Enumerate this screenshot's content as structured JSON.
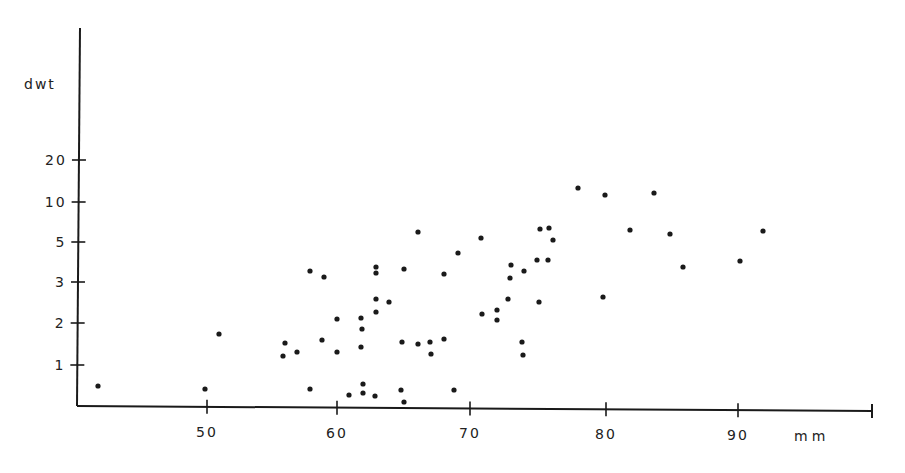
{
  "chart_data": {
    "type": "scatter",
    "title": "",
    "xlabel": "mm",
    "ylabel": "dwt",
    "x_ticks": [
      50,
      60,
      70,
      80,
      90
    ],
    "y_ticks": [
      1,
      2,
      3,
      5,
      10,
      20
    ],
    "xlim": [
      40,
      100
    ],
    "y_scale": "log-like (non-uniform)",
    "grid": false,
    "legend": null,
    "points": [
      {
        "x": 41.8,
        "y": 0.5
      },
      {
        "x": 50,
        "y": 0.4
      },
      {
        "x": 51,
        "y": 1.7
      },
      {
        "x": 56,
        "y": 1.5
      },
      {
        "x": 56,
        "y": 1.2
      },
      {
        "x": 57,
        "y": 1.3
      },
      {
        "x": 58,
        "y": 3.3
      },
      {
        "x": 58,
        "y": 0.4
      },
      {
        "x": 59,
        "y": 3.1
      },
      {
        "x": 59,
        "y": 1.6
      },
      {
        "x": 60,
        "y": 2.1
      },
      {
        "x": 60,
        "y": 1.3
      },
      {
        "x": 61,
        "y": 0.3
      },
      {
        "x": 62,
        "y": 2.1
      },
      {
        "x": 62,
        "y": 1.85
      },
      {
        "x": 62,
        "y": 1.4
      },
      {
        "x": 62,
        "y": 0.55
      },
      {
        "x": 62,
        "y": 0.35
      },
      {
        "x": 63,
        "y": 3.4
      },
      {
        "x": 63,
        "y": 3.2
      },
      {
        "x": 63,
        "y": 2.6
      },
      {
        "x": 63,
        "y": 2.3
      },
      {
        "x": 63,
        "y": 0.3
      },
      {
        "x": 64,
        "y": 2.5
      },
      {
        "x": 65,
        "y": 1.5
      },
      {
        "x": 65,
        "y": 3.4
      },
      {
        "x": 65,
        "y": 0.4
      },
      {
        "x": 65,
        "y": 0.1
      },
      {
        "x": 66,
        "y": 6
      },
      {
        "x": 66,
        "y": 1.5
      },
      {
        "x": 67,
        "y": 1.5
      },
      {
        "x": 67,
        "y": 1.25
      },
      {
        "x": 68,
        "y": 3.2
      },
      {
        "x": 68,
        "y": 1.6
      },
      {
        "x": 69,
        "y": 0.4
      },
      {
        "x": 69,
        "y": 4.2
      },
      {
        "x": 71,
        "y": 5.3
      },
      {
        "x": 71,
        "y": 2.2
      },
      {
        "x": 72,
        "y": 2.3
      },
      {
        "x": 72,
        "y": 2.1
      },
      {
        "x": 73,
        "y": 2.6
      },
      {
        "x": 73,
        "y": 3.1
      },
      {
        "x": 73,
        "y": 3.5
      },
      {
        "x": 74,
        "y": 1.5
      },
      {
        "x": 74,
        "y": 1.2
      },
      {
        "x": 74,
        "y": 3.3
      },
      {
        "x": 75,
        "y": 2.5
      },
      {
        "x": 75,
        "y": 3.6
      },
      {
        "x": 75,
        "y": 6.3
      },
      {
        "x": 76,
        "y": 3.6
      },
      {
        "x": 76,
        "y": 6.4
      },
      {
        "x": 76,
        "y": 5.2
      },
      {
        "x": 78,
        "y": 13
      },
      {
        "x": 80,
        "y": 2.6
      },
      {
        "x": 80,
        "y": 11.5
      },
      {
        "x": 82,
        "y": 6.2
      },
      {
        "x": 84,
        "y": 12
      },
      {
        "x": 85,
        "y": 5.8
      },
      {
        "x": 86,
        "y": 3.6
      },
      {
        "x": 90,
        "y": 3.9
      },
      {
        "x": 92,
        "y": 6.2
      }
    ]
  },
  "layout": {
    "x_tick_px": {
      "50": 207,
      "60": 337,
      "70": 470,
      "80": 606,
      "90": 738
    },
    "y_tick_px": {
      "1": 365,
      "2": 323,
      "3": 282,
      "5": 242,
      "10": 202,
      "20": 160
    },
    "points_px": [
      [
        98,
        386
      ],
      [
        205,
        389
      ],
      [
        219,
        334
      ],
      [
        285,
        343
      ],
      [
        283,
        356
      ],
      [
        297,
        352
      ],
      [
        310,
        271
      ],
      [
        310,
        389
      ],
      [
        324,
        277
      ],
      [
        322,
        340
      ],
      [
        337,
        319
      ],
      [
        337,
        352
      ],
      [
        349,
        395
      ],
      [
        361,
        318
      ],
      [
        362,
        329
      ],
      [
        361,
        347
      ],
      [
        363,
        384
      ],
      [
        363,
        393
      ],
      [
        376,
        267
      ],
      [
        376,
        273
      ],
      [
        376,
        299
      ],
      [
        376,
        312
      ],
      [
        375,
        396
      ],
      [
        389,
        302
      ],
      [
        402,
        342
      ],
      [
        404,
        269
      ],
      [
        401,
        390
      ],
      [
        404,
        402
      ],
      [
        418,
        232
      ],
      [
        418,
        344
      ],
      [
        430,
        342
      ],
      [
        431,
        354
      ],
      [
        444,
        274
      ],
      [
        444,
        339
      ],
      [
        454,
        390
      ],
      [
        458,
        253
      ],
      [
        481,
        238
      ],
      [
        482,
        314
      ],
      [
        497,
        310
      ],
      [
        497,
        320
      ],
      [
        508,
        299
      ],
      [
        510,
        278
      ],
      [
        511,
        265
      ],
      [
        522,
        342
      ],
      [
        523,
        355
      ],
      [
        524,
        271
      ],
      [
        539,
        302
      ],
      [
        537,
        260
      ],
      [
        540,
        229
      ],
      [
        548,
        260
      ],
      [
        549,
        228
      ],
      [
        553,
        240
      ],
      [
        578,
        188
      ],
      [
        603,
        297
      ],
      [
        605,
        195
      ],
      [
        630,
        230
      ],
      [
        654,
        193
      ],
      [
        670,
        234
      ],
      [
        683,
        267
      ],
      [
        740,
        261
      ],
      [
        763,
        231
      ]
    ]
  },
  "colors": {
    "ink": "#1a1a1a",
    "background": "#ffffff"
  }
}
